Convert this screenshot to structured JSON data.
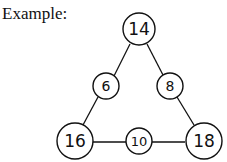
{
  "label": "Example:",
  "nodes": {
    "top": "14",
    "left_mid": "6",
    "right_mid": "8",
    "bottom_left": "16",
    "bottom_mid": "10",
    "bottom_right": "18"
  }
}
